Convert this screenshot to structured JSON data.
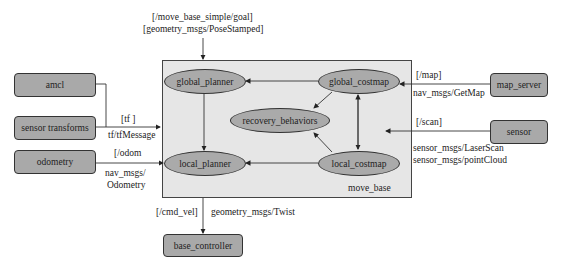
{
  "container": {
    "label": "move_base"
  },
  "internal_nodes": {
    "global_planner": "global_planner",
    "global_costmap": "global_costmap",
    "recovery_behaviors": "recovery_behaviors",
    "local_planner": "local_planner",
    "local_costmap": "local_costmap"
  },
  "external_nodes": {
    "amcl": "amcl",
    "sensor_transforms": "sensor transforms",
    "odometry": "odometry",
    "map_server": "map_server",
    "sensor": "sensor",
    "base_controller": "base_controller"
  },
  "edge_labels": {
    "goal_topic": "[/move_base_simple/goal]",
    "goal_type": "[geometry_msgs/PoseStamped]",
    "tf_topic": "[tf ]",
    "tf_type": "tf/tfMessage",
    "odom_topic": "[/odom",
    "odom_type_1": "nav_msgs/",
    "odom_type_2": "Odometry",
    "map_topic": "[/map]",
    "map_type": "nav_msgs/GetMap",
    "scan_topic": "[/scan]",
    "scan_type_1": "sensor_msgs/LaserScan",
    "scan_type_2": "sensor_msgs/pointCloud",
    "cmd_vel_topic": "[/cmd_vel]",
    "cmd_vel_type": "geometry_msgs/Twist"
  },
  "colors": {
    "node_fill": "#a9a9a9",
    "container_fill": "#e6e6e6",
    "stroke": "#333333"
  }
}
